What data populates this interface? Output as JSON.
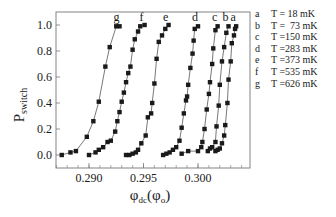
{
  "chart_data": {
    "type": "line",
    "title": "",
    "xlabel": "φdc(φ0)",
    "xlabel_main": "φ",
    "xlabel_sub": "dc",
    "xlabel_paren_main": "φ",
    "xlabel_paren_sub": "o",
    "ylabel": "Pswitch",
    "ylabel_main": "P",
    "ylabel_sub": "switch",
    "xlim": [
      0.2868,
      0.3047
    ],
    "ylim": [
      -0.1,
      1.1
    ],
    "xticks": [
      0.29,
      0.295,
      0.3
    ],
    "xtick_labels": [
      "0.290",
      "0.295",
      "0.300"
    ],
    "yticks": [
      0.0,
      0.2,
      0.4,
      0.6,
      0.8,
      1.0
    ],
    "ytick_labels": [
      "0.0",
      "0.2",
      "0.4",
      "0.6",
      "0.8",
      "1.0"
    ],
    "grid": false,
    "marker": "square",
    "legend_position": "right-outside",
    "series": [
      {
        "name": "a",
        "label": "T = 18 mK",
        "x": [
          0.3016,
          0.3018,
          0.302,
          0.3022,
          0.3024,
          0.3025,
          0.3027,
          0.3028,
          0.303,
          0.3031,
          0.3033,
          0.3034,
          0.3035
        ],
        "y": [
          0.03,
          0.04,
          0.05,
          0.09,
          0.15,
          0.23,
          0.4,
          0.58,
          0.72,
          0.86,
          0.92,
          0.97,
          0.99
        ]
      },
      {
        "name": "b",
        "label": "T = 73 mK",
        "x": [
          0.3009,
          0.3011,
          0.3013,
          0.3016,
          0.3017,
          0.3019,
          0.302,
          0.3022,
          0.3024,
          0.3026,
          0.3028
        ],
        "y": [
          0.03,
          0.05,
          0.06,
          0.1,
          0.22,
          0.38,
          0.54,
          0.72,
          0.83,
          0.94,
          0.99
        ]
      },
      {
        "name": "c",
        "label": "T =150 mK",
        "x": [
          0.2985,
          0.2991,
          0.3,
          0.3003,
          0.3004,
          0.3006,
          0.3008,
          0.301,
          0.3011,
          0.3013,
          0.3014,
          0.3016,
          0.3018
        ],
        "y": [
          0.01,
          0.03,
          0.03,
          0.06,
          0.1,
          0.2,
          0.35,
          0.47,
          0.56,
          0.7,
          0.82,
          0.96,
          0.99
        ]
      },
      {
        "name": "d",
        "label": "T =283 mK",
        "x": [
          0.2968,
          0.2971,
          0.2974,
          0.2977,
          0.298,
          0.2983,
          0.2985,
          0.2987,
          0.2989,
          0.299,
          0.2991,
          0.2993,
          0.2995,
          0.2996,
          0.2997,
          0.3
        ],
        "y": [
          0.0,
          0.01,
          0.02,
          0.04,
          0.06,
          0.11,
          0.21,
          0.32,
          0.42,
          0.45,
          0.54,
          0.67,
          0.78,
          0.88,
          0.97,
          0.99
        ]
      },
      {
        "name": "e",
        "label": "T =373 mK",
        "x": [
          0.2934,
          0.2937,
          0.294,
          0.2943,
          0.2945,
          0.2948,
          0.2952,
          0.2954,
          0.2957,
          0.2958,
          0.296,
          0.2962,
          0.2964,
          0.2967,
          0.297,
          0.2973
        ],
        "y": [
          0.0,
          0.0,
          0.01,
          0.02,
          0.04,
          0.09,
          0.15,
          0.29,
          0.32,
          0.4,
          0.55,
          0.74,
          0.87,
          0.92,
          0.97,
          1.0
        ]
      },
      {
        "name": "f",
        "label": "T =535 mK",
        "x": [
          0.29,
          0.2906,
          0.2909,
          0.2913,
          0.2917,
          0.292,
          0.2924,
          0.2926,
          0.2928,
          0.293,
          0.2932,
          0.2934,
          0.2936,
          0.2938,
          0.294,
          0.2942,
          0.2945,
          0.2947,
          0.2951
        ],
        "y": [
          0.0,
          0.02,
          0.04,
          0.06,
          0.1,
          0.11,
          0.18,
          0.26,
          0.33,
          0.41,
          0.48,
          0.56,
          0.63,
          0.68,
          0.81,
          0.89,
          0.95,
          0.99,
          1.0
        ]
      },
      {
        "name": "g",
        "label": "T =626 mK",
        "x": [
          0.2875,
          0.2883,
          0.2888,
          0.2898,
          0.2904,
          0.2909,
          0.2915,
          0.2919,
          0.2925,
          0.2928
        ],
        "y": [
          0.0,
          0.02,
          0.03,
          0.14,
          0.26,
          0.41,
          0.68,
          0.83,
          0.99,
          0.99
        ]
      }
    ]
  },
  "legend": {
    "items": [
      {
        "key": "a",
        "label": "T = 18 mK"
      },
      {
        "key": "b",
        "label": "T =  73 mK"
      },
      {
        "key": "c",
        "label": "T =150 mK"
      },
      {
        "key": "d",
        "label": "T =283 mK"
      },
      {
        "key": "e",
        "label": "T =373 mK"
      },
      {
        "key": "f",
        "label": "T =535 mK"
      },
      {
        "key": "g",
        "label": "T =626 mK"
      }
    ]
  },
  "colors": {
    "ink": "#1a1a1a",
    "line": "#555555",
    "frame": "#777777",
    "background": "#ffffff"
  }
}
